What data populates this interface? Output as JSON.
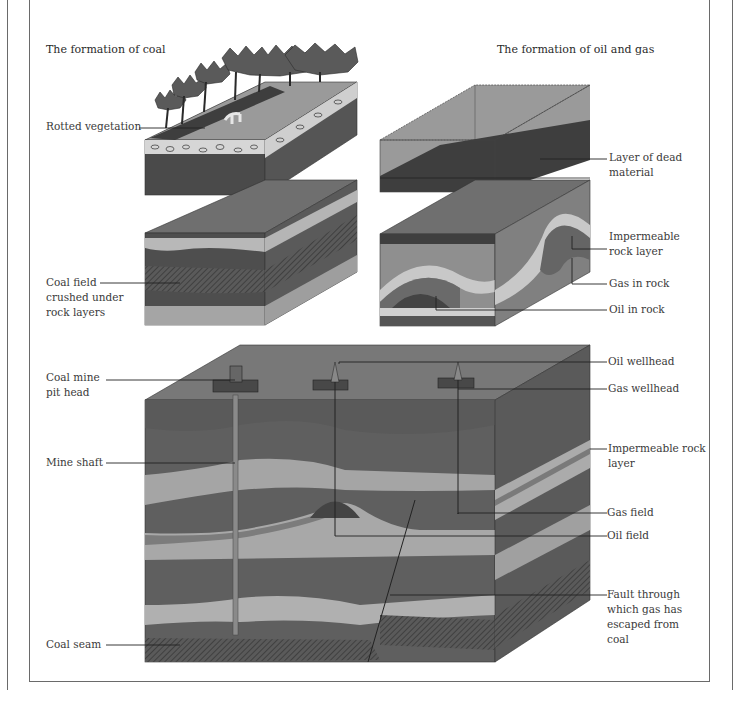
{
  "titles": {
    "coal": "The formation of coal",
    "oil_gas": "The formation of oil and gas"
  },
  "labels": {
    "rotted_vegetation": "Rotted vegetation",
    "layer_dead_material": "Layer of dead\nmaterial",
    "coal_field_crushed": "Coal field\ncrushed under\nrock layers",
    "impermeable_rock_layer_top": "Impermeable\nrock layer",
    "gas_in_rock": "Gas in rock",
    "oil_in_rock": "Oil in rock",
    "coal_mine_pit_head": "Coal mine\npit head",
    "oil_wellhead": "Oil wellhead",
    "gas_wellhead": "Gas wellhead",
    "mine_shaft": "Mine shaft",
    "impermeable_rock_layer_bottom": "Impermeable rock\nlayer",
    "gas_field": "Gas field",
    "oil_field": "Oil field",
    "fault": "Fault through\nwhich gas has\nescaped from\ncoal",
    "coal_seam": "Coal seam"
  },
  "colors": {
    "dark_rock": "#4e4e4e",
    "mid_rock": "#727272",
    "light_rock": "#a9a9a9",
    "pale_rock": "#c4c4c4",
    "top_surface": "#7d7d7d",
    "side_shade": "#5a5a5a",
    "line": "#222222",
    "frame": "#6a6a6a"
  }
}
